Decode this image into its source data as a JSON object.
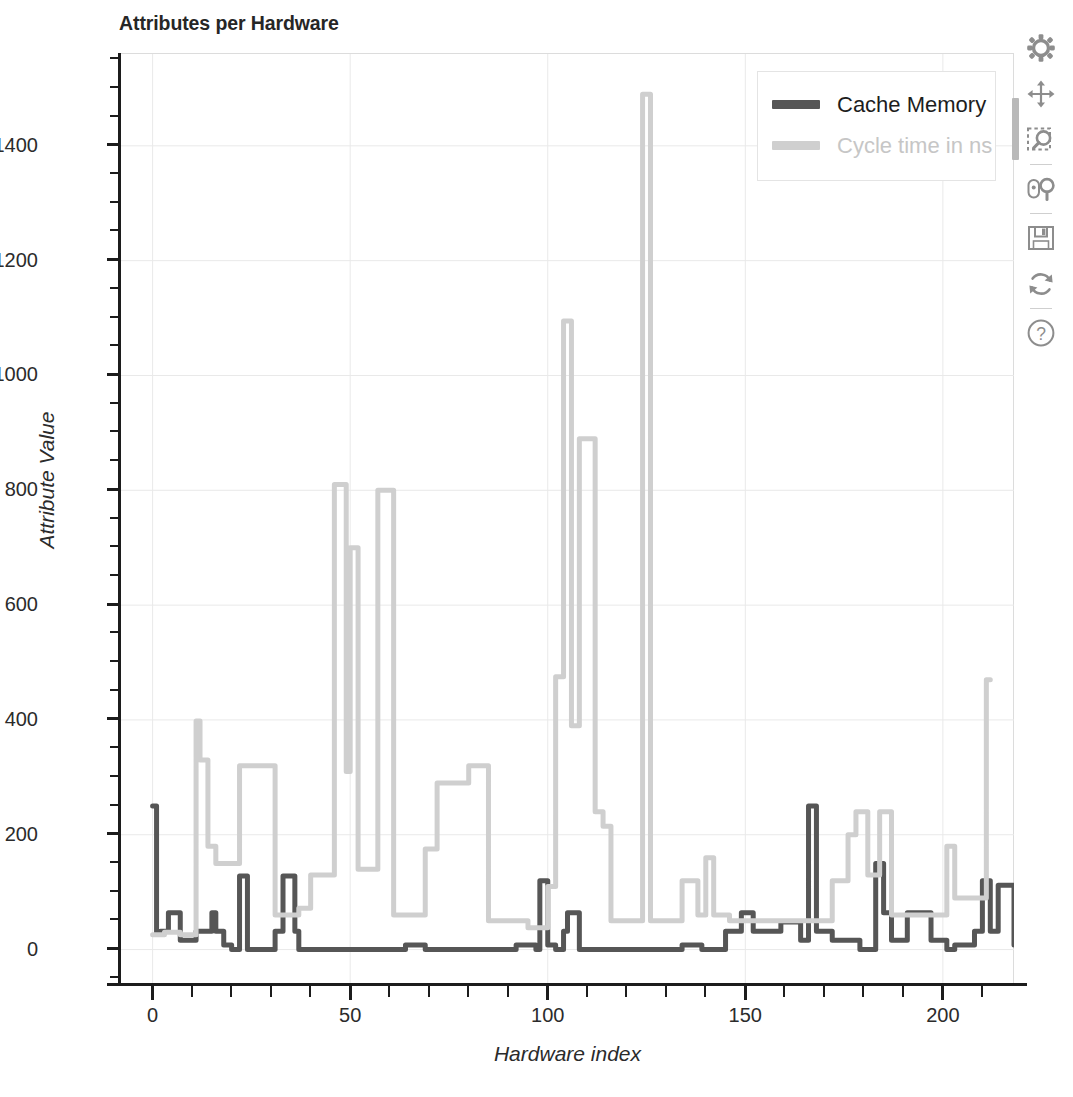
{
  "chart_data": {
    "type": "line",
    "title": "Attributes per Hardware",
    "xlabel": "Hardware index",
    "ylabel": "Attribute Value",
    "xlim": [
      -8,
      218
    ],
    "ylim": [
      -60,
      1560
    ],
    "xticks": [
      0,
      50,
      100,
      150,
      200
    ],
    "yticks": [
      0,
      200,
      400,
      600,
      800,
      1000,
      1200,
      1400
    ],
    "x_minor_step": 10,
    "y_minor_step": 50,
    "grid": true,
    "legend_position": "top-right",
    "series": [
      {
        "name": "Cache Memory",
        "color": "#565656",
        "values": [
          250,
          30,
          32,
          32,
          64,
          64,
          64,
          16,
          16,
          16,
          16,
          32,
          32,
          32,
          32,
          64,
          32,
          32,
          8,
          8,
          0,
          0,
          128,
          128,
          0,
          0,
          0,
          0,
          0,
          0,
          0,
          32,
          32,
          128,
          128,
          128,
          32,
          0,
          0,
          0,
          0,
          0,
          0,
          0,
          0,
          0,
          0,
          0,
          0,
          0,
          0,
          0,
          0,
          0,
          0,
          0,
          0,
          0,
          0,
          0,
          0,
          0,
          0,
          0,
          8,
          8,
          8,
          8,
          8,
          0,
          0,
          0,
          0,
          0,
          0,
          0,
          0,
          0,
          0,
          0,
          0,
          0,
          0,
          0,
          0,
          0,
          0,
          0,
          0,
          0,
          0,
          0,
          8,
          8,
          8,
          8,
          8,
          0,
          120,
          120,
          8,
          8,
          0,
          0,
          32,
          64,
          64,
          64,
          0,
          0,
          0,
          0,
          0,
          0,
          0,
          0,
          0,
          0,
          0,
          0,
          0,
          0,
          0,
          0,
          0,
          0,
          0,
          0,
          0,
          0,
          0,
          0,
          0,
          0,
          8,
          8,
          8,
          8,
          8,
          0,
          0,
          0,
          0,
          0,
          0,
          32,
          32,
          32,
          32,
          64,
          64,
          64,
          32,
          32,
          32,
          32,
          32,
          32,
          32,
          48,
          48,
          48,
          48,
          48,
          16,
          16,
          250,
          250,
          32,
          32,
          32,
          32,
          16,
          16,
          16,
          16,
          16,
          16,
          16,
          0,
          0,
          0,
          0,
          150,
          150,
          64,
          64,
          16,
          16,
          16,
          16,
          64,
          64,
          64,
          64,
          64,
          64,
          16,
          16,
          16,
          16,
          0,
          0,
          8,
          8,
          8,
          8,
          8,
          32,
          32,
          120,
          120,
          32,
          32,
          112,
          112,
          112,
          112,
          8,
          0,
          0,
          0,
          0,
          0,
          0,
          16,
          16
        ]
      },
      {
        "name": "Cycle time in ns",
        "color": "#cfcfcf",
        "values": [
          26,
          26,
          26,
          30,
          30,
          30,
          30,
          26,
          26,
          26,
          26,
          398,
          330,
          330,
          180,
          180,
          150,
          150,
          150,
          150,
          150,
          150,
          320,
          320,
          320,
          320,
          320,
          320,
          320,
          320,
          320,
          60,
          60,
          60,
          60,
          60,
          60,
          72,
          72,
          72,
          130,
          130,
          130,
          130,
          130,
          130,
          810,
          810,
          810,
          310,
          700,
          700,
          140,
          140,
          140,
          140,
          140,
          800,
          800,
          800,
          800,
          60,
          60,
          60,
          60,
          60,
          60,
          60,
          60,
          175,
          175,
          175,
          290,
          290,
          290,
          290,
          290,
          290,
          290,
          290,
          320,
          320,
          320,
          320,
          320,
          50,
          50,
          50,
          50,
          50,
          50,
          50,
          50,
          50,
          50,
          38,
          38,
          38,
          38,
          38,
          110,
          110,
          475,
          475,
          1095,
          1095,
          390,
          390,
          890,
          890,
          890,
          890,
          240,
          240,
          215,
          215,
          50,
          50,
          50,
          50,
          50,
          50,
          50,
          50,
          1490,
          1490,
          50,
          50,
          50,
          50,
          50,
          50,
          50,
          50,
          120,
          120,
          120,
          120,
          60,
          60,
          160,
          160,
          60,
          60,
          60,
          60,
          50,
          50,
          50,
          50,
          50,
          50,
          50,
          50,
          50,
          50,
          50,
          50,
          50,
          50,
          50,
          50,
          50,
          50,
          50,
          50,
          50,
          50,
          50,
          50,
          50,
          50,
          120,
          120,
          120,
          120,
          200,
          200,
          240,
          240,
          240,
          130,
          130,
          130,
          240,
          240,
          240,
          60,
          60,
          60,
          60,
          60,
          60,
          60,
          60,
          60,
          60,
          60,
          60,
          60,
          60,
          180,
          180,
          90,
          90,
          90,
          90,
          90,
          90,
          90,
          90,
          470,
          470
        ]
      }
    ]
  },
  "legend": {
    "entries": [
      {
        "label": "Cache Memory",
        "color": "#565656"
      },
      {
        "label": "Cycle time in ns",
        "color": "#cfcfcf"
      }
    ]
  },
  "toolbar": {
    "items": [
      {
        "name": "configure-subplots-icon",
        "label": "Configure subplots"
      },
      {
        "name": "pan-icon",
        "label": "Pan"
      },
      {
        "name": "zoom-to-rectangle-icon",
        "label": "Zoom to rectangle"
      },
      {
        "name": "zoom-mouse-icon",
        "label": "Zoom with mouse"
      },
      {
        "name": "save-icon",
        "label": "Save figure"
      },
      {
        "name": "reset-icon",
        "label": "Reset view"
      },
      {
        "name": "help-icon",
        "label": "Help"
      }
    ]
  },
  "colors": {
    "series_dark": "#565656",
    "series_light": "#cfcfcf",
    "grid": "#e9e9e9",
    "axis": "#1c1c1c",
    "text": "#2b2b2b",
    "background": "#ffffff"
  }
}
